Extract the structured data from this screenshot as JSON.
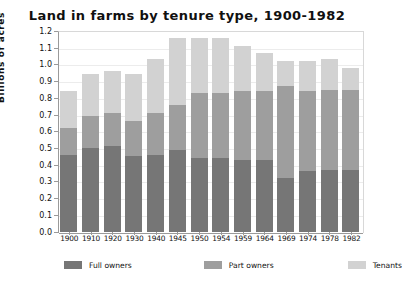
{
  "chart_data": {
    "type": "bar",
    "stacked": true,
    "title": "Land in farms by tenure type, 1900-1982",
    "xlabel": "",
    "ylabel": "Billions of acres",
    "ylim": [
      0.0,
      1.2
    ],
    "yticks": [
      "1.2",
      "1.1",
      "1.0",
      "0.9",
      "0.8",
      "0.7",
      "0.6",
      "0.5",
      "0.4",
      "0.3",
      "0.2",
      "0.1",
      "0.0"
    ],
    "grid": true,
    "legend_position": "bottom",
    "categories": [
      "1900",
      "1910",
      "1920",
      "1930",
      "1940",
      "1945",
      "1950",
      "1954",
      "1959",
      "1964",
      "1969",
      "1974",
      "1978",
      "1982"
    ],
    "series": [
      {
        "name": "Full owners",
        "color": "#767676",
        "values": [
          0.46,
          0.5,
          0.51,
          0.45,
          0.46,
          0.49,
          0.44,
          0.44,
          0.43,
          0.43,
          0.32,
          0.36,
          0.37,
          0.37
        ]
      },
      {
        "name": "Part owners",
        "color": "#9e9e9e",
        "values": [
          0.16,
          0.19,
          0.2,
          0.21,
          0.25,
          0.27,
          0.39,
          0.39,
          0.41,
          0.41,
          0.55,
          0.48,
          0.48,
          0.48
        ]
      },
      {
        "name": "Tenants",
        "color": "#d2d2d2",
        "values": [
          0.22,
          0.25,
          0.25,
          0.28,
          0.32,
          0.4,
          0.33,
          0.33,
          0.27,
          0.23,
          0.15,
          0.18,
          0.18,
          0.13
        ]
      }
    ],
    "totals": [
      0.84,
      0.94,
      0.96,
      0.94,
      1.03,
      1.16,
      1.16,
      1.16,
      1.11,
      1.07,
      1.02,
      1.02,
      1.03,
      0.98
    ]
  }
}
